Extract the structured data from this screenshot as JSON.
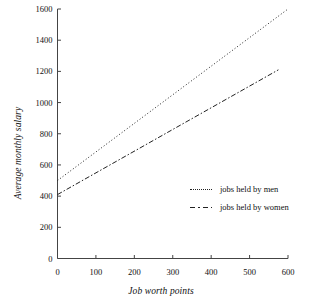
{
  "chart_data": {
    "type": "line",
    "title": "",
    "xlabel": "Job worth points",
    "ylabel": "Average monthly salary",
    "xlim": [
      0,
      600
    ],
    "ylim": [
      0,
      1600
    ],
    "xticks": [
      0,
      100,
      200,
      300,
      400,
      500,
      600
    ],
    "yticks": [
      0,
      200,
      400,
      600,
      800,
      1000,
      1200,
      1400,
      1600
    ],
    "grid": false,
    "legend_position": "inside-right",
    "series": [
      {
        "name": "jobs held by men",
        "style": "dotted",
        "color": "#222222",
        "x": [
          0,
          600
        ],
        "values": [
          500,
          1600
        ]
      },
      {
        "name": "jobs held by women",
        "style": "dash-dot",
        "color": "#222222",
        "x": [
          0,
          575
        ],
        "values": [
          410,
          1210
        ]
      }
    ]
  },
  "axes": {
    "y_title": "Average monthly salary",
    "x_title": "Job worth points",
    "y_tick_labels": [
      "1600",
      "1400",
      "1200",
      "1000",
      "800",
      "600",
      "400",
      "200",
      "0"
    ],
    "x_tick_labels": [
      "0",
      "100",
      "200",
      "300",
      "400",
      "500",
      "600"
    ]
  },
  "legend": {
    "entries": [
      {
        "label": "jobs held by men",
        "swatch": "dotted-line-icon"
      },
      {
        "label": "jobs held by women",
        "swatch": "dash-dot-line-icon"
      }
    ]
  }
}
